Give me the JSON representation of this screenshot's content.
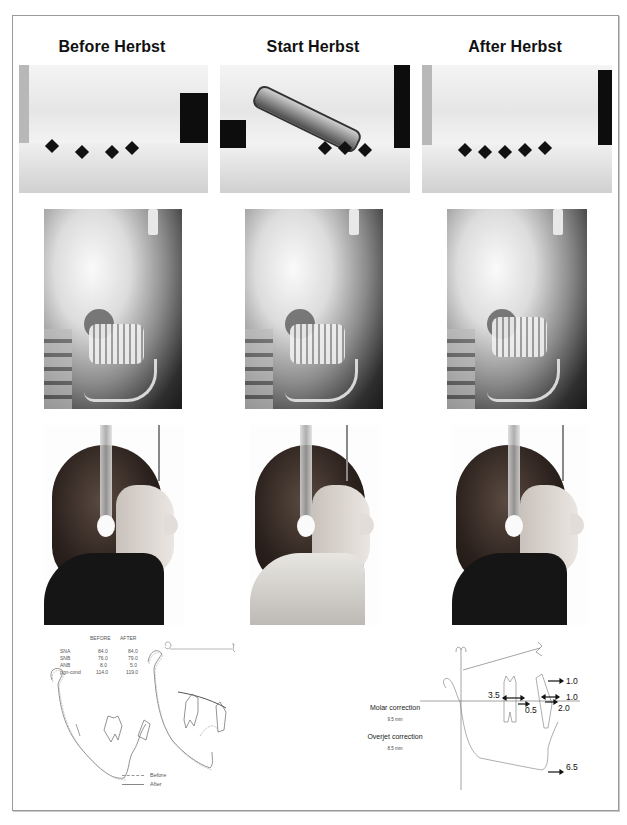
{
  "figure": {
    "columns": [
      {
        "title": "Before Herbst"
      },
      {
        "title": "Start Herbst"
      },
      {
        "title": "After Herbst"
      }
    ],
    "rows": [
      {
        "type": "intraoral-cast-photo",
        "items": [
          "Before Herbst cast",
          "Start Herbst cast with appliance",
          "After Herbst cast"
        ]
      },
      {
        "type": "lateral-cephalogram",
        "items": [
          "Before Herbst cephalogram",
          "Start Herbst cephalogram",
          "After Herbst cephalogram"
        ]
      },
      {
        "type": "facial-profile-photo",
        "items": [
          "Before Herbst profile",
          "Start Herbst profile",
          "After Herbst profile"
        ]
      }
    ]
  },
  "ceph_table": {
    "headers": [
      "BEFORE",
      "AFTER"
    ],
    "rows": [
      {
        "label": "SNA",
        "before": "84.0",
        "after": "84.0"
      },
      {
        "label": "SNB",
        "before": "76.0",
        "after": "79.0"
      },
      {
        "label": "ANB",
        "before": "8.0",
        "after": "5.0"
      },
      {
        "label": "pgn-cond",
        "before": "114.0",
        "after": "119.0"
      }
    ]
  },
  "tracing_legend": {
    "before": "Before",
    "after": "After"
  },
  "sos_analysis": {
    "molar_label": "Molar correction",
    "molar_value": "9.5 mm",
    "overjet_label": "Overjet correction",
    "overjet_value": "8.5 mm",
    "measurements": [
      "1.0",
      "1.0",
      "2.0",
      "3.5",
      "0.5",
      "6.5"
    ]
  }
}
